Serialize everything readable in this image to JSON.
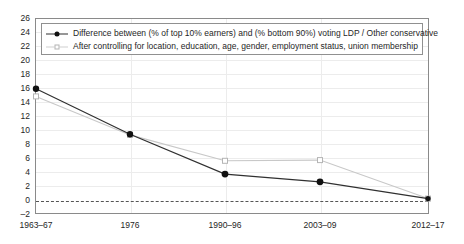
{
  "chart_data": {
    "type": "line",
    "title": "",
    "xlabel": "",
    "ylabel": "",
    "categories": [
      "1963–67",
      "1976",
      "1990–96",
      "2003–09",
      "2012–17"
    ],
    "ylim": [
      -2,
      26
    ],
    "ytick_step": 2,
    "yticks": [
      26,
      24,
      22,
      20,
      18,
      16,
      14,
      12,
      10,
      8,
      6,
      4,
      2,
      0,
      -2
    ],
    "grid": true,
    "legend_position": "top-left",
    "zero_reference_line": 0,
    "series": [
      {
        "name": "Difference between (% of top 10% earners) and (% bottom 90%) voting LDP / Other conservative",
        "values": [
          15.9,
          9.4,
          3.7,
          2.6,
          0.2
        ],
        "color": "#303030",
        "marker": "filled-circle",
        "marker_color": "#111111"
      },
      {
        "name": "After controlling for location, education, age, gender, employment status, union membership",
        "values": [
          14.8,
          9.3,
          5.6,
          5.7,
          0.2
        ],
        "color": "#c8c8c8",
        "marker": "open-square",
        "marker_color": "#b4b4b4"
      }
    ]
  },
  "legend": {
    "items": [
      {
        "label": "Difference between (% of top 10% earners) and (% bottom 90%) voting LDP / Other conservative",
        "key": "filled-circle-dark-line"
      },
      {
        "label": "After controlling for location, education, age, gender, employment status, union membership",
        "key": "open-square-light-line"
      }
    ]
  },
  "axes": {
    "y_tick_labels": [
      "26",
      "24",
      "22",
      "20",
      "18",
      "16",
      "14",
      "12",
      "10",
      "8",
      "6",
      "4",
      "2",
      "0",
      "–2"
    ],
    "x_tick_labels": [
      "1963–67",
      "1976",
      "1990–96",
      "2003–09",
      "2012–17"
    ]
  },
  "colors": {
    "series1": "#303030",
    "series2": "#c8c8c8",
    "grid": "#ececec",
    "frame": "#8a8a8a",
    "zero_line": "#555555",
    "text": "#262626"
  }
}
